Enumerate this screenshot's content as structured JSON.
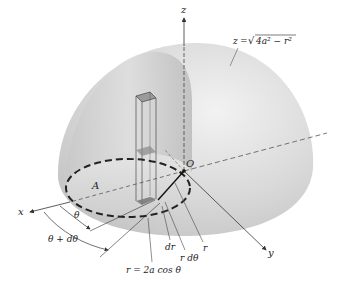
{
  "figure": {
    "surface_label": {
      "lhs": "z",
      "eq": "=",
      "rhs": "√4a² − r²",
      "radicand": "4a² − r²"
    },
    "axes": {
      "x": "x",
      "y": "y",
      "z": "z",
      "origin": "O"
    },
    "region_label": "A",
    "angle_labels": {
      "theta": "θ",
      "theta_plus": "θ + dθ"
    },
    "element_labels": {
      "dr": "dr",
      "rdtheta": "r dθ",
      "r": "r"
    },
    "curve_label": "r = 2a cos θ"
  }
}
